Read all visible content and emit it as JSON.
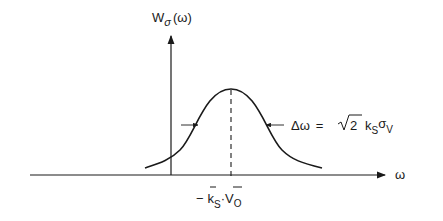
{
  "diagram": {
    "type": "gaussian-spectrum",
    "y_axis_label": {
      "main": "W",
      "subscript": "σ",
      "arg": "(ω)"
    },
    "x_axis_label": "ω",
    "peak_label": {
      "minus": "−",
      "k": "k",
      "k_sub": "S",
      "dot": "·",
      "v": "V",
      "v_sub": "O"
    },
    "width_label": {
      "delta": "Δω",
      "equals": "=",
      "sqrt_arg": "2",
      "k": "k",
      "k_sub": "S",
      "sigma": "σ",
      "sigma_sub": "V"
    },
    "colors": {
      "ink": "#1a1a1a",
      "background": "#ffffff"
    }
  }
}
